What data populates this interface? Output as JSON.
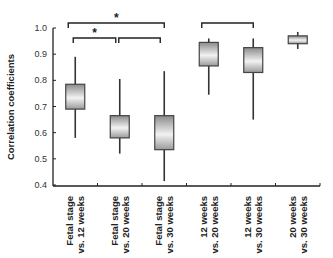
{
  "chart_data": {
    "type": "boxplot",
    "title": "",
    "xlabel": "",
    "ylabel": "Correlation coefficients",
    "ylim": [
      0.4,
      1.0
    ],
    "yticks": [
      "0.4",
      "0.5",
      "0.6",
      "0.7",
      "0.8",
      "0.9",
      "1.0"
    ],
    "grid": false,
    "legend": null,
    "categories": [
      [
        "Fetal stage",
        "vs. 12 weeks"
      ],
      [
        "Fetal stage",
        "vs. 20 weeks"
      ],
      [
        "Fetal stage",
        "vs. 30 weeks"
      ],
      [
        "12 weeks",
        "vs. 20 weeks"
      ],
      [
        "12 weeks",
        "vs. 30 weeks"
      ],
      [
        "20 weeks",
        "vs. 30 weeks"
      ]
    ],
    "boxes": [
      {
        "whisker_low": 0.58,
        "q1": 0.69,
        "q3": 0.785,
        "whisker_high": 0.89
      },
      {
        "whisker_low": 0.52,
        "q1": 0.58,
        "q3": 0.665,
        "whisker_high": 0.805
      },
      {
        "whisker_low": 0.415,
        "q1": 0.535,
        "q3": 0.665,
        "whisker_high": 0.835
      },
      {
        "whisker_low": 0.745,
        "q1": 0.855,
        "q3": 0.945,
        "whisker_high": 0.96
      },
      {
        "whisker_low": 0.65,
        "q1": 0.83,
        "q3": 0.925,
        "whisker_high": 0.96
      },
      {
        "whisker_low": 0.92,
        "q1": 0.94,
        "q3": 0.97,
        "whisker_high": 0.985
      }
    ],
    "annotations": [
      {
        "type": "bracket",
        "from": 0,
        "to": 2,
        "level": "upper",
        "label": "*"
      },
      {
        "type": "bracket",
        "from": 0,
        "to": 1,
        "level": "lower",
        "label": "*"
      },
      {
        "type": "bracket",
        "from": 1,
        "to": 2,
        "level": "lower",
        "label": ""
      },
      {
        "type": "bracket",
        "from": 3,
        "to": 4,
        "level": "upper",
        "label": ""
      }
    ]
  }
}
